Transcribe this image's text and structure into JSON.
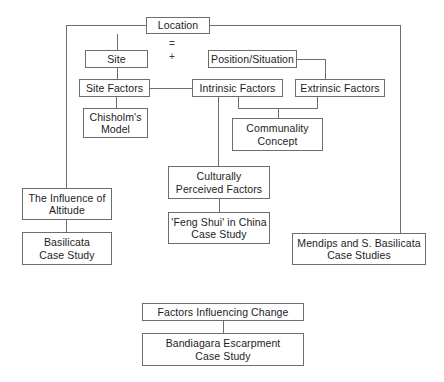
{
  "diagram": {
    "canvas": {
      "width": 444,
      "height": 382
    },
    "style": {
      "box_border_color": "#6d6d6d",
      "line_color": "#6d6d6d",
      "background_color": "#ffffff",
      "text_color": "#1c1c1c"
    },
    "operators": [
      {
        "id": "op-equals",
        "symbol": "=",
        "x": 172,
        "y": 44
      },
      {
        "id": "op-plus",
        "symbol": "+",
        "x": 172,
        "y": 57
      }
    ],
    "nodes": [
      {
        "id": "location",
        "label": "Location",
        "x": 146,
        "y": 17,
        "w": 64,
        "h": 17
      },
      {
        "id": "site",
        "label": "Site",
        "x": 85,
        "y": 50,
        "w": 63,
        "h": 18
      },
      {
        "id": "position",
        "label": "Position/Situation",
        "x": 208,
        "y": 50,
        "w": 89,
        "h": 18
      },
      {
        "id": "site-factors",
        "label": "Site Factors",
        "x": 79,
        "y": 79,
        "w": 71,
        "h": 18
      },
      {
        "id": "intrinsic",
        "label": "Intrinsic Factors",
        "x": 192,
        "y": 79,
        "w": 91,
        "h": 18
      },
      {
        "id": "extrinsic",
        "label": "Extrinsic Factors",
        "x": 295,
        "y": 79,
        "w": 90,
        "h": 18
      },
      {
        "id": "chisholm",
        "label": "Chisholm's\nModel",
        "x": 83,
        "y": 108,
        "w": 65,
        "h": 30
      },
      {
        "id": "communality",
        "label": "Communality\nConcept",
        "x": 232,
        "y": 118,
        "w": 91,
        "h": 33
      },
      {
        "id": "culturally",
        "label": "Culturally\nPerceived Factors",
        "x": 168,
        "y": 166,
        "w": 102,
        "h": 33
      },
      {
        "id": "influence",
        "label": "The Influence of\nAltitude",
        "x": 22,
        "y": 188,
        "w": 90,
        "h": 32
      },
      {
        "id": "fengshui",
        "label": "'Feng Shui' in China\nCase Study",
        "x": 168,
        "y": 212,
        "w": 102,
        "h": 32
      },
      {
        "id": "basilicata",
        "label": "Basilicata\nCase Study",
        "x": 22,
        "y": 232,
        "w": 90,
        "h": 33
      },
      {
        "id": "mendips",
        "label": "Mendips and S. Basilicata\nCase Studies",
        "x": 292,
        "y": 233,
        "w": 134,
        "h": 32
      },
      {
        "id": "factors-change",
        "label": "Factors Influencing Change",
        "x": 142,
        "y": 303,
        "w": 162,
        "h": 18
      },
      {
        "id": "bandiagara",
        "label": "Bandiagara Escarpment\nCase Study",
        "x": 142,
        "y": 333,
        "w": 162,
        "h": 33
      }
    ],
    "edges": [
      {
        "id": "edge-location-left-branch",
        "from": "location",
        "to": "influence",
        "points": "146,25 66,25 66,188"
      },
      {
        "id": "edge-location-right-branch",
        "from": "location",
        "to": "mendips",
        "points": "210,25 400,25 400,233"
      },
      {
        "id": "edge-location-site",
        "from": "location",
        "to": "site",
        "points": "117,34 117,50"
      },
      {
        "id": "edge-site-sitefactors",
        "from": "site",
        "to": "site-factors",
        "points": "117,68 117,79"
      },
      {
        "id": "edge-sitefactors-intrinsic",
        "from": "site-factors",
        "to": "intrinsic",
        "points": "150,88 192,88"
      },
      {
        "id": "edge-sitefactors-chisholm",
        "from": "site-factors",
        "to": "chisholm",
        "points": "116,97 116,108"
      },
      {
        "id": "edge-position-extrinsic",
        "from": "position",
        "to": "extrinsic",
        "points": "297,59 325,59 325,79"
      },
      {
        "id": "edge-intrinsic-communality",
        "from": "intrinsic",
        "to": "communality",
        "points": "238,97 238,108 317,108 317,97"
      },
      {
        "id": "edge-bracket-communality",
        "from": "intrinsic",
        "to": "communality",
        "points": "278,108 278,118"
      },
      {
        "id": "edge-intrinsic-culturally",
        "from": "intrinsic",
        "to": "culturally",
        "points": "218,97 218,166"
      },
      {
        "id": "edge-culturally-fengshui",
        "from": "culturally",
        "to": "fengshui",
        "points": "219,199 219,212"
      },
      {
        "id": "edge-influence-basilicata",
        "from": "influence",
        "to": "basilicata",
        "points": "66,220 66,232"
      },
      {
        "id": "edge-factors-bandiagara",
        "from": "factors-change",
        "to": "bandiagara",
        "points": "223,321 223,333"
      }
    ]
  }
}
